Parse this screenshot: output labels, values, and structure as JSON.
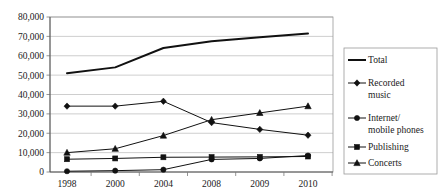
{
  "chart_data": {
    "type": "line",
    "title": "",
    "xlabel": "",
    "ylabel": "",
    "categories": [
      "1998",
      "2000",
      "2004",
      "2008",
      "2009",
      "2010"
    ],
    "ylim": [
      0,
      80000
    ],
    "ytick_labels": [
      "0",
      "10,000",
      "20,000",
      "30,000",
      "40,000",
      "50,000",
      "60,000",
      "70,000",
      "80,000"
    ],
    "ytick_values": [
      0,
      10000,
      20000,
      30000,
      40000,
      50000,
      60000,
      70000,
      80000
    ],
    "grid": true,
    "legend_position": "right",
    "series": [
      {
        "name": "Total",
        "marker": "none",
        "color": "#111111",
        "values": [
          51000,
          54000,
          64000,
          67500,
          69500,
          71500
        ]
      },
      {
        "name": "Recorded music",
        "marker": "diamond",
        "color": "#111111",
        "values": [
          34000,
          34000,
          36500,
          25500,
          22000,
          19000
        ]
      },
      {
        "name": "Internet/ mobile phones",
        "marker": "circle",
        "color": "#111111",
        "values": [
          400,
          700,
          1200,
          6500,
          7000,
          8500
        ]
      },
      {
        "name": "Publishing",
        "marker": "square",
        "color": "#111111",
        "values": [
          6600,
          7000,
          7600,
          7700,
          7800,
          8000
        ]
      },
      {
        "name": "Concerts",
        "marker": "triangle",
        "color": "#111111",
        "values": [
          10000,
          12000,
          18800,
          27000,
          30500,
          34000
        ]
      }
    ]
  },
  "legend": {
    "entries": [
      {
        "label_line1": "Total",
        "label_line2": "",
        "marker": "none"
      },
      {
        "label_line1": "Recorded",
        "label_line2": "music",
        "marker": "diamond"
      },
      {
        "label_line1": "Internet/",
        "label_line2": "mobile phones",
        "marker": "circle"
      },
      {
        "label_line1": "Publishing",
        "label_line2": "",
        "marker": "square"
      },
      {
        "label_line1": "Concerts",
        "label_line2": "",
        "marker": "triangle"
      }
    ]
  }
}
